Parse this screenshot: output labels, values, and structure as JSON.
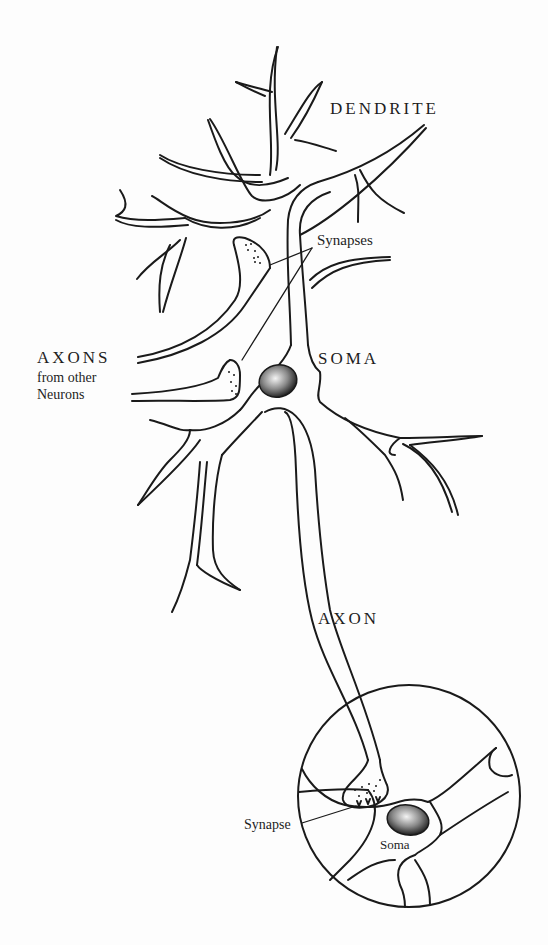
{
  "diagram": {
    "labels": {
      "dendrite": "DENDRITE",
      "synapses": "Synapses",
      "axons_main": "AXONS",
      "axons_sub_1": "from other",
      "axons_sub_2": "Neurons",
      "soma": "SOMA",
      "axon": "AXON",
      "synapse": "Synapse",
      "inset_soma": "Soma"
    },
    "colors": {
      "line": "#1a1a1a",
      "background": "#fdfdfd",
      "nucleus_dark": "#2a2a2a",
      "nucleus_light": "#f2f2f2"
    }
  }
}
